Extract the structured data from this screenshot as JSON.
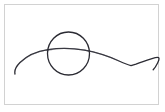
{
  "canvas": {
    "width": 165,
    "height": 112,
    "background_color": "#ffffff",
    "frame": {
      "border_color": "#d2d2d2",
      "fill_color": "#ffffff",
      "x": 4,
      "y": 4,
      "width": 155,
      "height": 101
    }
  },
  "drawing": {
    "type": "freehand-sketch",
    "stroke_color": "#2b2b33",
    "stroke_width": 1.3,
    "strokes": [
      {
        "name": "wavy-baseline-curve",
        "description": "long horizontal hand-drawn wavy line with a left downward tail, a broad hump under the circle, a descent to an angular bend on the right, and a small upward hook at the far right end",
        "path": "M 10 69 C 9.2 65.5 11 61.5 15 57.5 C 22 50.5 32 46.2 43 44.6 C 55 42.9 68 43.2 79.5 45.2 C 92 47.4 104 51.5 114 56 C 119 58.3 123 60 126 60.6 L 131 59.2 C 136 57.2 142 55.2 147 53.6 C 150 52.7 152.5 52.2 153.5 52.6 C 154.4 53.2 154 55.3 152.6 58 C 151.2 60.8 149.5 63.4 148.2 64.8"
      },
      {
        "name": "circle-outline",
        "description": "hand-drawn circle overlapping the left-center of the wavy line",
        "cx": 63.5,
        "cy": 48.5,
        "rx": 21,
        "ry": 21.5
      }
    ]
  },
  "accessibility": {
    "alt_text": "Hand-drawn sketch: a circle over a long wavy horizontal line"
  }
}
